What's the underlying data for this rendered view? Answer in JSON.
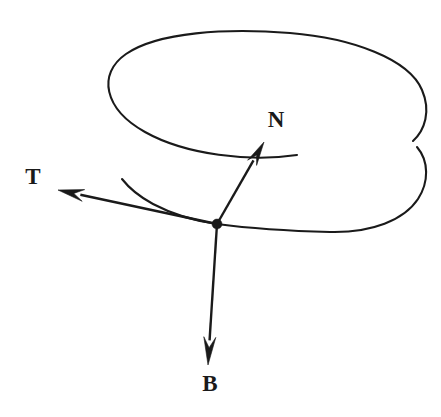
{
  "figure": {
    "background_color": "#ffffff",
    "ink_color": "#1a1a1a",
    "width": 441,
    "height": 417
  },
  "labels": {
    "tangent": "T",
    "normal": "N",
    "binormal": "B"
  },
  "chart_data": {
    "type": "diagram",
    "background": "#ffffff",
    "stroke": "#1a1a1a",
    "origin": {
      "name": "point-on-curve",
      "x": 217,
      "y": 224,
      "radius": 5
    },
    "curve": {
      "name": "helix-spiral",
      "description": "open spiral: one full elliptical turn plus a descending partial turn",
      "segments": [
        {
          "name": "upper-turn",
          "d": "M 297 155 C 250 162 186 155 145 132 C 104 109 97 74 126 54 C 158 32 226 28 290 33 C 352 38 409 59 422 90 C 431 111 425 130 413 141"
        },
        {
          "name": "lower-turn",
          "d": "M 417 147 C 429 161 429 182 418 199 C 404 220 372 233 330 232 C 290 231 247 228 217 224"
        },
        {
          "name": "lower-turn-left-tail",
          "d": "M 217 224 C 196 221 172 214 153 204 C 140 197 129 188 122 179"
        }
      ]
    },
    "vectors": [
      {
        "name": "tangent-vector",
        "label": "T",
        "from": {
          "x": 217,
          "y": 224
        },
        "to": {
          "x": 58,
          "y": 190
        },
        "label_pos": {
          "x": 33,
          "y": 176
        }
      },
      {
        "name": "normal-vector",
        "label": "N",
        "from": {
          "x": 217,
          "y": 224
        },
        "to": {
          "x": 264,
          "y": 142
        },
        "label_pos": {
          "x": 276,
          "y": 119
        }
      },
      {
        "name": "binormal-vector",
        "label": "B",
        "from": {
          "x": 217,
          "y": 224
        },
        "to": {
          "x": 208,
          "y": 365
        },
        "label_pos": {
          "x": 210,
          "y": 383
        }
      }
    ]
  }
}
